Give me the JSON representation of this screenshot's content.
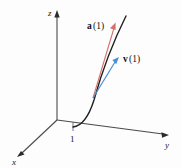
{
  "figure": {
    "background_color": "#fdfdfd"
  },
  "axes": {
    "z": {
      "label": "z",
      "arrow": "up"
    },
    "y": {
      "label": "y",
      "arrow": "right"
    },
    "x": {
      "label": "x",
      "arrow": "down-left"
    },
    "color": "#4a4a4a"
  },
  "ticks": [
    {
      "label": "1",
      "axis": "y"
    }
  ],
  "curve": {
    "name": "space-curve",
    "color": "#1f1f1f"
  },
  "vectors": [
    {
      "id": "acceleration",
      "label_bold": "a",
      "label_arg": "(1)",
      "color": "#d4726a"
    },
    {
      "id": "velocity",
      "label_bold": "v",
      "label_arg": "(1)",
      "color": "#4a8fd4"
    }
  ]
}
